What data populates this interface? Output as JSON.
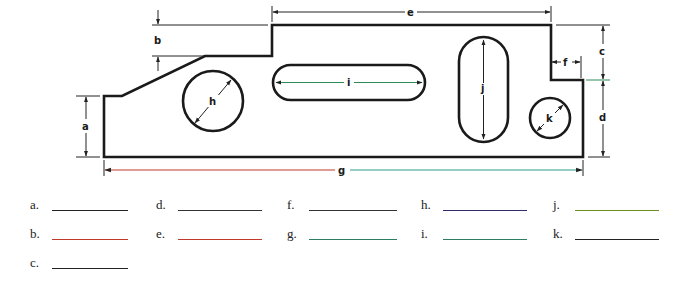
{
  "diagram": {
    "dimension_labels": {
      "a": "a",
      "b": "b",
      "c": "c",
      "d": "d",
      "e": "e",
      "f": "f",
      "g": "g",
      "h": "h",
      "i": "i",
      "j": "j",
      "k": "k"
    },
    "colors": {
      "outline": "#1a1a1a",
      "dimension_line": "#222222",
      "g_left": "#c0392b",
      "g_right": "#2a9d8f",
      "i_line": "#2e8b57",
      "d_tick": "#2e8b57"
    }
  },
  "answers": [
    {
      "letter": "a.",
      "line_color": "#222222"
    },
    {
      "letter": "b.",
      "line_color": "#c0392b"
    },
    {
      "letter": "c.",
      "line_color": "#222222"
    },
    {
      "letter": "d.",
      "line_color": "#333333"
    },
    {
      "letter": "e.",
      "line_color": "#c0392b"
    },
    {
      "letter": "f.",
      "line_color": "#333333"
    },
    {
      "letter": "g.",
      "line_color": "#2a7f62"
    },
    {
      "letter": "h.",
      "line_color": "#2c2c6e"
    },
    {
      "letter": "i.",
      "line_color": "#2a7f62"
    },
    {
      "letter": "j.",
      "line_color": "#6b8e23"
    },
    {
      "letter": "k.",
      "line_color": "#222222"
    }
  ]
}
